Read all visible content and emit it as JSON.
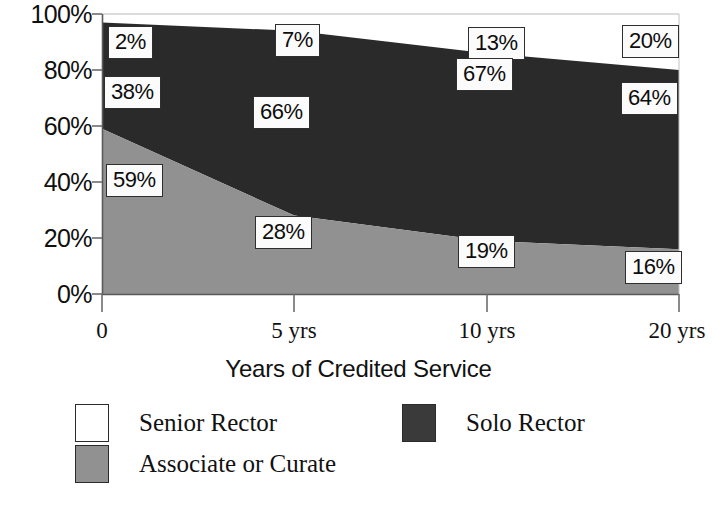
{
  "chart_data": {
    "type": "area",
    "stacked": true,
    "normalized": "100%",
    "title": "",
    "xlabel": "Years of Credited Service",
    "ylabel": "",
    "categories": [
      "0",
      "5 yrs",
      "10 yrs",
      "20 yrs"
    ],
    "ytick_labels": [
      "100%",
      "80%",
      "60%",
      "40%",
      "20%",
      "0%"
    ],
    "yticks": [
      100,
      80,
      60,
      40,
      20,
      0
    ],
    "ylim": [
      0,
      100
    ],
    "grid": false,
    "legend_position": "bottom",
    "stack_order_bottom_to_top": [
      "Associate or Curate",
      "Solo Rector",
      "Senior Rector"
    ],
    "series": [
      {
        "name": "Senior Rector",
        "color": "#ffffff",
        "values": [
          2,
          7,
          13,
          20
        ],
        "labels": [
          "2%",
          "7%",
          "13%",
          "20%"
        ]
      },
      {
        "name": "Solo Rector",
        "color": "#2a2a2a",
        "values": [
          38,
          66,
          67,
          64
        ],
        "labels": [
          "38%",
          "66%",
          "67%",
          "64%"
        ]
      },
      {
        "name": "Associate or Curate",
        "color": "#919191",
        "values": [
          59,
          28,
          19,
          16
        ],
        "labels": [
          "59%",
          "28%",
          "19%",
          "16%"
        ]
      }
    ],
    "data_labels": [
      {
        "text": "2%",
        "series": "Senior Rector",
        "category": "0"
      },
      {
        "text": "7%",
        "series": "Senior Rector",
        "category": "5 yrs"
      },
      {
        "text": "13%",
        "series": "Senior Rector",
        "category": "10 yrs"
      },
      {
        "text": "20%",
        "series": "Senior Rector",
        "category": "20 yrs"
      },
      {
        "text": "38%",
        "series": "Solo Rector",
        "category": "0"
      },
      {
        "text": "66%",
        "series": "Solo Rector",
        "category": "5 yrs"
      },
      {
        "text": "67%",
        "series": "Solo Rector",
        "category": "10 yrs"
      },
      {
        "text": "64%",
        "series": "Solo Rector",
        "category": "20 yrs"
      },
      {
        "text": "59%",
        "series": "Associate or Curate",
        "category": "0"
      },
      {
        "text": "28%",
        "series": "Associate or Curate",
        "category": "5 yrs"
      },
      {
        "text": "19%",
        "series": "Associate or Curate",
        "category": "10 yrs"
      },
      {
        "text": "16%",
        "series": "Associate or Curate",
        "category": "20 yrs"
      }
    ]
  },
  "axis": {
    "y_labels": {
      "t100": "100%",
      "t80": "80%",
      "t60": "60%",
      "t40": "40%",
      "t20": "20%",
      "t0": "0%"
    },
    "x_labels": {
      "c0": "0",
      "c1": "5 yrs",
      "c2": "10 yrs",
      "c3": "20 yrs"
    },
    "x_title": "Years of Credited Service"
  },
  "labels": {
    "senior_0": "2%",
    "senior_1": "7%",
    "senior_2": "13%",
    "senior_3": "20%",
    "solo_0": "38%",
    "solo_1": "66%",
    "solo_2": "67%",
    "solo_3": "64%",
    "assoc_0": "59%",
    "assoc_1": "28%",
    "assoc_2": "19%",
    "assoc_3": "16%"
  },
  "legend": {
    "items": [
      {
        "label": "Senior Rector",
        "color": "#ffffff"
      },
      {
        "label": "Solo Rector",
        "color": "#2a2a2a"
      },
      {
        "label": "Associate or Curate",
        "color": "#919191"
      }
    ]
  },
  "colors": {
    "senior_rector": "#ffffff",
    "solo_rector": "#2a2a2a",
    "associate_or_curate": "#919191",
    "axis": "#555555",
    "text": "#111111",
    "label_box_bg": "#fbfbfb",
    "label_box_border": "#2e2e2e"
  }
}
